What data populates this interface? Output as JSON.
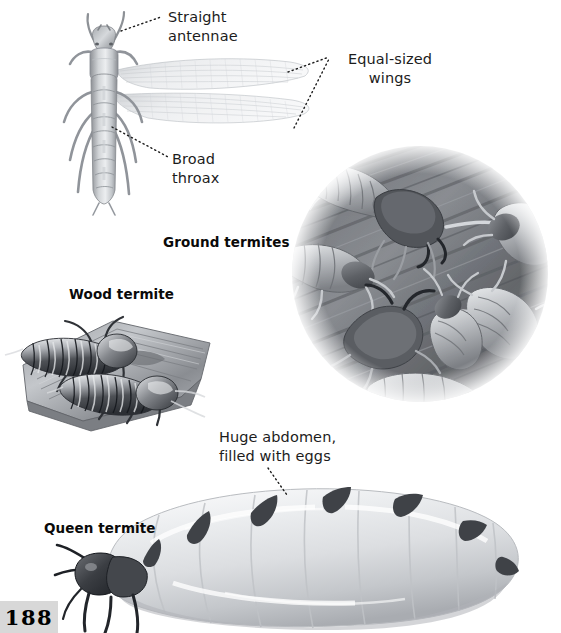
{
  "page": {
    "number": "188",
    "background_color": "#ffffff",
    "page_number_box_color": "#d8d8d8",
    "text_color": "#1c1c1c",
    "heading_color": "#0a0a0a"
  },
  "callouts": [
    {
      "id": "straight-antennae",
      "text": "Straight\nantennae"
    },
    {
      "id": "equal-sized-wings",
      "text": "Equal-sized\nwings"
    },
    {
      "id": "broad-thorax",
      "text": "Broad\nthroax"
    },
    {
      "id": "huge-abdomen",
      "text": "Huge abdomen,\nfilled with eggs"
    }
  ],
  "headings": [
    {
      "id": "ground-termites",
      "text": "Ground termites"
    },
    {
      "id": "wood-termite",
      "text": "Wood termite"
    },
    {
      "id": "queen-termite",
      "text": "Queen termite"
    }
  ],
  "figures": [
    {
      "id": "winged-termite",
      "name": "winged-termite-illustration",
      "description": "Dorsal view of a winged termite (alate) with straight antennae, broad thorax and two pairs of equal-sized translucent wings"
    },
    {
      "id": "ground-termites",
      "name": "ground-termites-illustration",
      "description": "Circular vignette of ground termites, soldiers and workers, crawling over wood grain"
    },
    {
      "id": "wood-termite",
      "name": "wood-termite-illustration",
      "description": "Two wood termites resting on a chunk of split wood"
    },
    {
      "id": "queen-termite",
      "name": "queen-termite-illustration",
      "description": "Queen termite with small dark head and thorax and a greatly enlarged pale abdomen filled with eggs"
    }
  ]
}
